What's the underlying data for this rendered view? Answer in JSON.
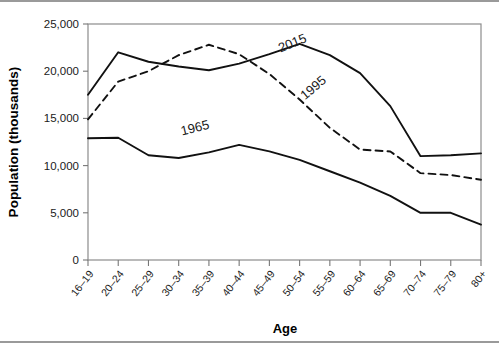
{
  "chart_data": {
    "type": "line",
    "title": "",
    "xlabel": "Age",
    "ylabel": "Population (thousands)",
    "categories": [
      "16–19",
      "20–24",
      "25–29",
      "30–34",
      "35–39",
      "40–44",
      "45–49",
      "50–54",
      "55–59",
      "60–64",
      "65–69",
      "70–74",
      "75–79",
      "80+"
    ],
    "ylim": [
      0,
      25000
    ],
    "yticks": [
      0,
      5000,
      10000,
      15000,
      20000,
      25000
    ],
    "ytick_labels": [
      "0",
      "5,000",
      "10,000",
      "15,000",
      "20,000",
      "25,000"
    ],
    "grid": false,
    "legend_position": "inline-annotations",
    "series": [
      {
        "name": "2015",
        "style": "solid",
        "color": "#111111",
        "values": [
          17500,
          22000,
          21000,
          20500,
          20100,
          20800,
          21800,
          22900,
          21700,
          19800,
          16300,
          11000,
          11100,
          11300
        ]
      },
      {
        "name": "1995",
        "style": "dashed",
        "color": "#111111",
        "values": [
          14900,
          18900,
          20000,
          21700,
          22800,
          21800,
          19700,
          17000,
          14000,
          11700,
          11500,
          9200,
          9000,
          8500
        ]
      },
      {
        "name": "1965",
        "style": "solid",
        "color": "#111111",
        "values": [
          12900,
          12950,
          11100,
          10800,
          11400,
          12200,
          11500,
          10600,
          9400,
          8200,
          6800,
          5000,
          5000,
          3750
        ]
      }
    ],
    "annotations": [
      {
        "text": "2015",
        "x_px": 294,
        "y_px": 45,
        "rotation": -22
      },
      {
        "text": "1995",
        "x_px": 316,
        "y_px": 89,
        "rotation": -40
      },
      {
        "text": "1965",
        "x_px": 196,
        "y_px": 130,
        "rotation": -14
      }
    ]
  }
}
